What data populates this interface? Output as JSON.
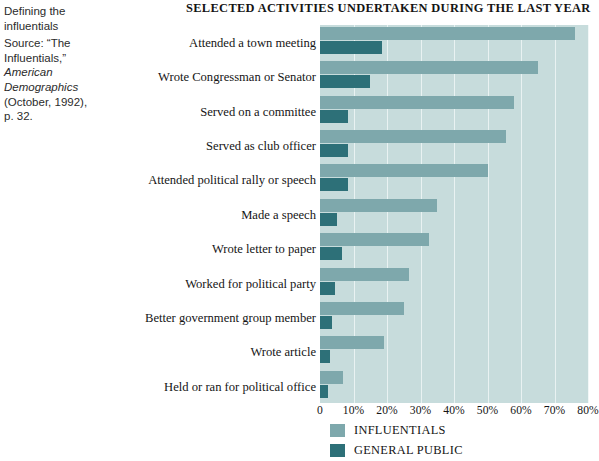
{
  "sidenote": {
    "heading": "Defining the influentials",
    "source_line1": "Source: “The",
    "source_line2": "Influentials,”",
    "source_italic1": "American",
    "source_italic2": "Demographics",
    "source_line3": "(October, 1992),",
    "source_line4": "p. 32."
  },
  "legend": {
    "influentials_label": "INFLUENTIALS",
    "general_public_label": "GENERAL PUBLIC",
    "influentials_color": "#7ea8ac",
    "general_public_color": "#2d7078"
  },
  "colors": {
    "plot_background": "#c7dcdc",
    "gridline": "#eef6f6",
    "page_background": "#ffffff",
    "text": "#151515"
  },
  "chart_data": {
    "type": "bar",
    "orientation": "horizontal",
    "title": "SELECTED ACTIVITIES UNDERTAKEN DURING THE LAST YEAR",
    "xlabel": "",
    "ylabel": "",
    "xlim": [
      0,
      80
    ],
    "xticks": [
      0,
      10,
      20,
      30,
      40,
      50,
      60,
      70,
      80
    ],
    "xtick_labels": [
      "0",
      "10%",
      "20%",
      "30%",
      "40%",
      "50%",
      "60%",
      "70%",
      "80%"
    ],
    "grid": true,
    "legend_position": "bottom-left",
    "categories": [
      "Attended a town meeting",
      "Wrote Congressman or Senator",
      "Served on a committee",
      "Served as club officer",
      "Attended political rally or speech",
      "Made a speech",
      "Wrote letter to paper",
      "Worked for political party",
      "Better government group member",
      "Wrote article",
      "Held or ran for political office"
    ],
    "series": [
      {
        "name": "INFLUENTIALS",
        "color": "#7ea8ac",
        "values": [
          76,
          65,
          58,
          55.5,
          50,
          35,
          32.5,
          26.5,
          25,
          19,
          7
        ]
      },
      {
        "name": "GENERAL PUBLIC",
        "color": "#2d7078",
        "values": [
          18.5,
          15,
          8.5,
          8.5,
          8.5,
          5,
          6.5,
          4.5,
          3.5,
          3,
          2.5
        ]
      }
    ]
  }
}
